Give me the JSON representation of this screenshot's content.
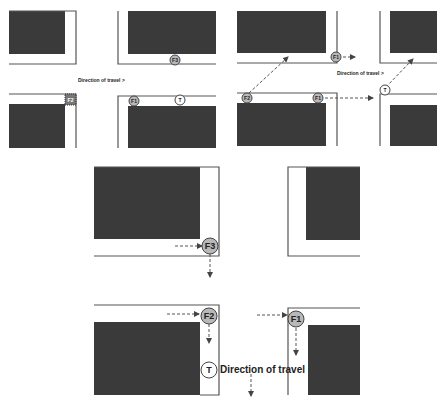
{
  "panels": {
    "top_left": {
      "direction_label": "Direction of travel >",
      "markers": {
        "f3": "F3",
        "f2": "F2",
        "f1": "F1",
        "t": "T"
      }
    },
    "top_right": {
      "direction_label": "Direction of travel >",
      "markers": {
        "f1_top": "F1",
        "f2": "F2",
        "f1": "F1",
        "t": "T"
      }
    },
    "bottom": {
      "direction_label": "Direction of travel",
      "markers": {
        "f3": "F3",
        "f2": "F2",
        "f1": "F1",
        "t": "T"
      }
    }
  },
  "colors": {
    "block": "#3a3a3a",
    "kerb": "#555555",
    "fire_marker": "#b8b8b8",
    "target_marker": "#ffffff"
  }
}
